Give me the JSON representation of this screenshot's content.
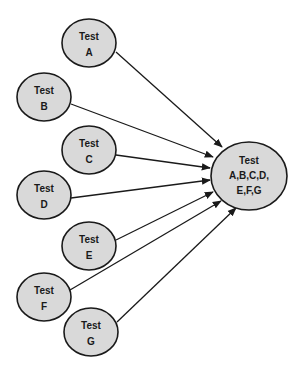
{
  "diagram": {
    "type": "dependency-graph",
    "colors": {
      "node_fill": "#d9d9d9",
      "stroke": "#1a1a1a",
      "background": "#ffffff"
    },
    "sources": [
      {
        "id": "A",
        "line1": "Test",
        "line2": "A",
        "cx": 89,
        "cy": 43
      },
      {
        "id": "B",
        "line1": "Test",
        "line2": "B",
        "cx": 44,
        "cy": 97
      },
      {
        "id": "C",
        "line1": "Test",
        "line2": "C",
        "cx": 89,
        "cy": 150
      },
      {
        "id": "D",
        "line1": "Test",
        "line2": "D",
        "cx": 44,
        "cy": 195
      },
      {
        "id": "E",
        "line1": "Test",
        "line2": "E",
        "cx": 89,
        "cy": 246
      },
      {
        "id": "F",
        "line1": "Test",
        "line2": "F",
        "cx": 44,
        "cy": 297
      },
      {
        "id": "G",
        "line1": "Test",
        "line2": "G",
        "cx": 91,
        "cy": 332
      }
    ],
    "target": {
      "id": "ABCDEFG",
      "line1": "Test",
      "line2": "A,B,C,D,",
      "line3": "E,F,G",
      "cx": 249,
      "cy": 176
    },
    "edges": [
      {
        "from": "A",
        "to": "ABCDEFG"
      },
      {
        "from": "B",
        "to": "ABCDEFG"
      },
      {
        "from": "C",
        "to": "ABCDEFG"
      },
      {
        "from": "D",
        "to": "ABCDEFG"
      },
      {
        "from": "E",
        "to": "ABCDEFG"
      },
      {
        "from": "F",
        "to": "ABCDEFG"
      },
      {
        "from": "G",
        "to": "ABCDEFG"
      }
    ]
  }
}
